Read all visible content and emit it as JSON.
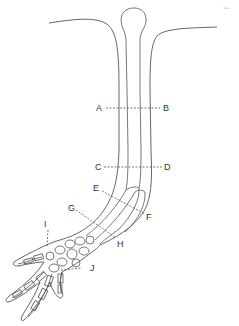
{
  "figure": {
    "corner_mark": "· ʟ ʟ.",
    "colors": {
      "line": "#555555",
      "label": "#333333",
      "background": "#ffffff"
    }
  },
  "section_lines": [
    {
      "id": "AB",
      "start": "A",
      "end": "B"
    },
    {
      "id": "CD",
      "start": "C",
      "end": "D"
    },
    {
      "id": "EF",
      "start": "E",
      "end": "F"
    },
    {
      "id": "GH",
      "start": "G",
      "end": "H"
    }
  ],
  "labels": {
    "A": "A",
    "B": "B",
    "C": "C",
    "D": "D",
    "E": "E",
    "F": "F",
    "G": "G",
    "H": "H",
    "I": "I",
    "J": "J"
  }
}
